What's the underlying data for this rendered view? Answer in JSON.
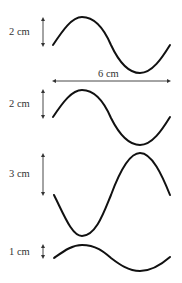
{
  "diagram": {
    "colors": {
      "wave": "#111111",
      "dimension": "#333333",
      "text": "#333333"
    },
    "wavelength_label": "6 cm",
    "waves": [
      {
        "id": "wave-1",
        "amplitude_label": "2 cm",
        "phase": "starts-rising"
      },
      {
        "id": "wave-2",
        "amplitude_label": "2 cm",
        "phase": "starts-rising"
      },
      {
        "id": "wave-3",
        "amplitude_label": "3 cm",
        "phase": "starts-falling"
      },
      {
        "id": "wave-4",
        "amplitude_label": "1 cm",
        "phase": "starts-rising"
      }
    ]
  }
}
